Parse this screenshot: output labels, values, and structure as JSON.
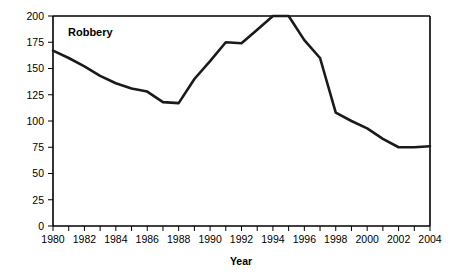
{
  "chart_data": {
    "type": "line",
    "title": "",
    "series_label": "Robbery",
    "xlabel": "Year",
    "ylabel": "",
    "xlim": [
      1980,
      2004
    ],
    "ylim": [
      0,
      200
    ],
    "grid": false,
    "legend_position": "inside-top-left",
    "x": [
      1980,
      1981,
      1982,
      1983,
      1984,
      1985,
      1986,
      1987,
      1988,
      1989,
      1990,
      1991,
      1992,
      1993,
      1994,
      1995,
      1996,
      1997,
      1998,
      1999,
      2000,
      2001,
      2002,
      2003,
      2004
    ],
    "series": [
      {
        "name": "Robbery",
        "values": [
          167,
          160,
          152,
          143,
          136,
          131,
          128,
          118,
          117,
          140,
          157,
          175,
          174,
          187,
          200,
          200,
          177,
          160,
          108,
          100,
          93,
          83,
          75,
          75,
          76
        ]
      }
    ],
    "x_tick_values": [
      1980,
      1981,
      1982,
      1983,
      1984,
      1985,
      1986,
      1987,
      1988,
      1989,
      1990,
      1991,
      1992,
      1993,
      1994,
      1995,
      1996,
      1997,
      1998,
      1999,
      2000,
      2001,
      2002,
      2003,
      2004
    ],
    "x_tick_labels": [
      "1980",
      "",
      "1982",
      "",
      "1984",
      "",
      "1986",
      "",
      "1988",
      "",
      "1990",
      "",
      "1992",
      "",
      "1994",
      "",
      "1996",
      "",
      "1998",
      "",
      "2000",
      "",
      "2002",
      "",
      "2004"
    ],
    "y_tick_values": [
      0,
      25,
      50,
      75,
      100,
      125,
      150,
      175,
      200
    ],
    "y_tick_labels": [
      "0",
      "25",
      "50",
      "75",
      "100",
      "125",
      "150",
      "175",
      "200"
    ],
    "line_color": "#1a1a1a",
    "axis_color": "#000000",
    "background_color": "#ffffff"
  }
}
